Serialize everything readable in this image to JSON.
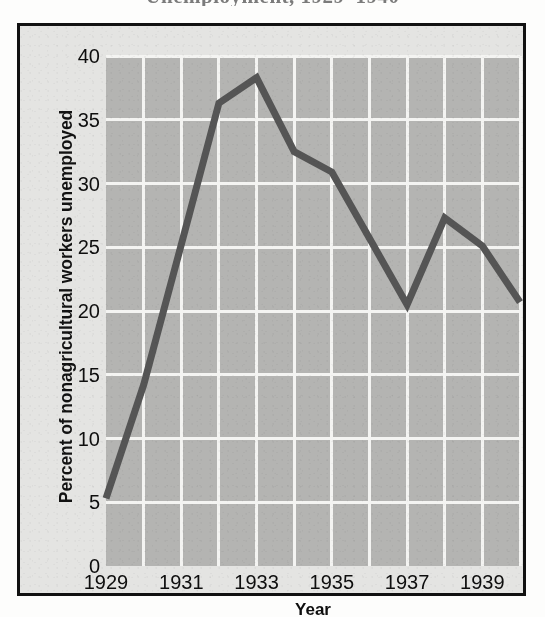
{
  "figure": {
    "title_remnant": "Unemployment, 1929–1940",
    "frame_color": "#111111",
    "plot_background_color": "#b4b4b2",
    "gridline_color": "#f4f4f2",
    "line_color": "#555555",
    "page_background_color": "#e4e4e2"
  },
  "axes": {
    "y_axis_title": "Percent of nonagricultural workers unemployed",
    "x_axis_title": "Year",
    "y_ticks": [
      "40",
      "35",
      "30",
      "25",
      "20",
      "15",
      "10",
      "5",
      "0"
    ],
    "x_ticks": [
      "1929",
      "1931",
      "1933",
      "1935",
      "1937",
      "1939"
    ]
  },
  "chart_data": {
    "type": "line",
    "title": "Unemployment, 1929–1940",
    "xlabel": "Year",
    "ylabel": "Percent of nonagricultural workers unemployed",
    "xlim": [
      1929,
      1940
    ],
    "ylim": [
      0,
      40
    ],
    "grid": true,
    "legend": "none",
    "x": [
      1929,
      1930,
      1931,
      1932,
      1933,
      1934,
      1935,
      1936,
      1937,
      1938,
      1939,
      1940
    ],
    "values": [
      5.3,
      14.2,
      25.2,
      36.3,
      38.3,
      32.5,
      30.9,
      25.7,
      20.5,
      27.3,
      25.1,
      20.7
    ],
    "series": [
      {
        "name": "Percent of nonagricultural workers unemployed",
        "values": [
          5.3,
          14.2,
          25.2,
          36.3,
          38.3,
          32.5,
          30.9,
          25.7,
          20.5,
          27.3,
          25.1,
          20.7
        ]
      }
    ],
    "x_tick_values": [
      1929,
      1931,
      1933,
      1935,
      1937,
      1939
    ],
    "y_tick_values": [
      0,
      5,
      10,
      15,
      20,
      25,
      30,
      35,
      40
    ]
  }
}
